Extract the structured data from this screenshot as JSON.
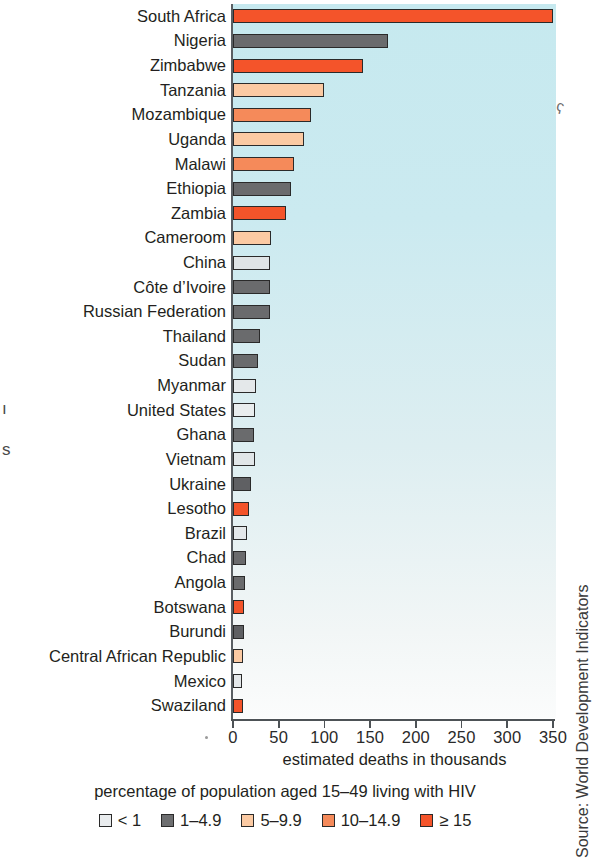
{
  "chart_data": {
    "type": "bar",
    "orientation": "horizontal",
    "title": "",
    "xlabel": "estimated deaths in thousands",
    "ylabel": "",
    "xlim": [
      0,
      350
    ],
    "xticks": [
      0,
      50,
      100,
      150,
      200,
      250,
      300,
      350
    ],
    "grid": false,
    "legend_title": "percentage of population aged 15–49 living with HIV",
    "legend_position": "bottom",
    "legend": [
      {
        "label": "< 1",
        "color": "#e9ecee"
      },
      {
        "label": "1–4.9",
        "color": "#6d6e70"
      },
      {
        "label": "5–9.9",
        "color": "#fbcaa3"
      },
      {
        "label": "10–14.9",
        "color": "#f58a5a"
      },
      {
        "label": "≥ 15",
        "color": "#f4542a"
      }
    ],
    "categories": [
      "South Africa",
      "Nigeria",
      "Zimbabwe",
      "Tanzania",
      "Mozambique",
      "Uganda",
      "Malawi",
      "Ethiopia",
      "Zambia",
      "Cameroom",
      "China",
      "Côte d’Ivoire",
      "Russian Federation",
      "Thailand",
      "Sudan",
      "Myanmar",
      "United States",
      "Ghana",
      "Vietnam",
      "Ukraine",
      "Lesotho",
      "Brazil",
      "Chad",
      "Angola",
      "Botswana",
      "Burundi",
      "Central African Republic",
      "Mexico",
      "Swaziland"
    ],
    "values": [
      350,
      170,
      142,
      99,
      85,
      78,
      67,
      63,
      58,
      42,
      40,
      40,
      41,
      30,
      27,
      25,
      24,
      23,
      24,
      20,
      18,
      15,
      14,
      13,
      12,
      12,
      11,
      10,
      11
    ],
    "bar_categories": [
      "≥ 15",
      "1–4.9",
      "≥ 15",
      "5–9.9",
      "10–14.9",
      "5–9.9",
      "10–14.9",
      "1–4.9",
      "≥ 15",
      "5–9.9",
      "< 1",
      "1–4.9",
      "1–4.9",
      "1–4.9",
      "1–4.9",
      "< 1",
      "< 1",
      "1–4.9",
      "< 1",
      "1–4.9",
      "≥ 15",
      "< 1",
      "1–4.9",
      "1–4.9",
      "≥ 15",
      "1–4.9",
      "5–9.9",
      "< 1",
      "≥ 15"
    ],
    "bar_colors": [
      "#f4542a",
      "#6a6b6d",
      "#f4542a",
      "#fbcaa3",
      "#f58a5a",
      "#fbcaa3",
      "#f58a5a",
      "#6a6b6d",
      "#f4542a",
      "#fbcaa3",
      "#dfe4e6",
      "#6a6b6d",
      "#6a6b6d",
      "#6a6b6d",
      "#6a6b6d",
      "#e4e8ea",
      "#e9edee",
      "#6a6b6d",
      "#e1e6e8",
      "#5f6063",
      "#f4542a",
      "#e4e8ea",
      "#6a6b6d",
      "#6a6b6d",
      "#f4542a",
      "#5f6063",
      "#fbcaa3",
      "#e4e8ea",
      "#f4542a"
    ]
  },
  "source": {
    "text": "Source: World Development Indicators"
  },
  "page_fragments": {
    "left_1": "ı",
    "left_2": "s",
    "stray_mark": "ʕ"
  }
}
